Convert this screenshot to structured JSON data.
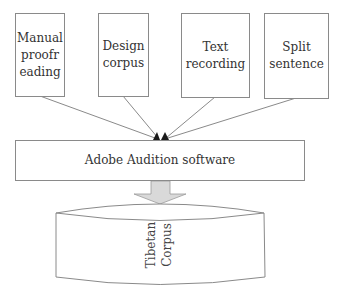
{
  "diagram": {
    "inputs": [
      {
        "id": "manual",
        "label": "Manual\nproofr\neading"
      },
      {
        "id": "design",
        "label": "Design\ncorpus"
      },
      {
        "id": "text",
        "label": "Text\nrecording"
      },
      {
        "id": "split",
        "label": "Split\nsentence"
      }
    ],
    "process": {
      "label": "Adobe Audition software"
    },
    "output": {
      "label": "Tibetan\nCorpus"
    },
    "colors": {
      "stroke": "#8a8a8a",
      "arrowhead": "#1a1a1a",
      "block_arrow_fill": "#d9d9d9"
    }
  }
}
